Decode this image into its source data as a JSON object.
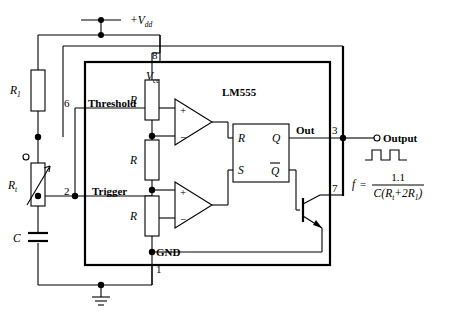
{
  "diagram": {
    "ic_label": "LM555",
    "supply_label": "+V",
    "supply_sub": "dd",
    "vcc_label": "V",
    "vcc_sub": "cc",
    "gnd_label": "GND",
    "out_label": "Out",
    "output_terminal_label": "Output",
    "threshold_label": "Threshold",
    "trigger_label": "Trigger"
  },
  "pins": {
    "vcc": "8",
    "ground": "1",
    "output": "3",
    "discharge": "7",
    "threshold": "6",
    "trigger": "2"
  },
  "components": {
    "r1": "R",
    "r1_sub": "1",
    "rt": "R",
    "rt_sub": "t",
    "c": "C",
    "divider": [
      "R",
      "R",
      "R"
    ]
  },
  "flipflop": {
    "r_input": "R",
    "s_input": "S",
    "q_output": "Q",
    "qbar_output": "Q"
  },
  "comparators": {
    "top_plus": "+",
    "top_minus": "−",
    "bottom_plus": "+",
    "bottom_minus": "−"
  },
  "formula": {
    "lhs": "f",
    "equals": "=",
    "numerator": "1.1",
    "denom_c": "C",
    "denom_open": "(",
    "denom_rt": "R",
    "denom_rt_sub": "t",
    "denom_plus": "+",
    "denom_2r1": "2R",
    "denom_2r1_sub": "1",
    "denom_close": ")"
  },
  "colors": {
    "wire": "#000000",
    "background": "#ffffff"
  }
}
